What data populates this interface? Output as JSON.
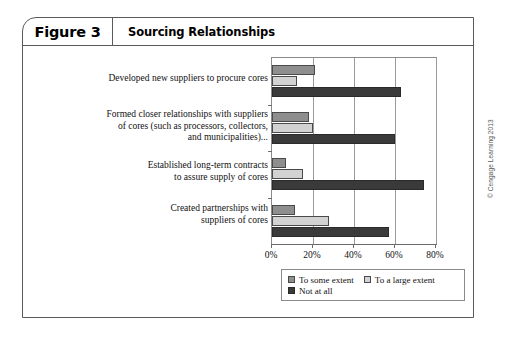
{
  "figure": {
    "number_label": "Figure 3",
    "title": "Sourcing Relationships",
    "copyright": "© Cengage Learning 2013"
  },
  "chart_data": {
    "type": "bar",
    "orientation": "horizontal",
    "title": "Sourcing Relationships",
    "xlabel": "",
    "ylabel": "",
    "xlim": [
      0,
      80
    ],
    "xticks": [
      0,
      20,
      40,
      60,
      80
    ],
    "xtick_labels": [
      "0%",
      "20%",
      "40%",
      "60%",
      "80%"
    ],
    "grid": true,
    "legend_position": "bottom",
    "categories": [
      "Developed new suppliers to procure cores",
      "Formed closer relationships with suppliers of cores (such as processors, collectors, and municipalities)...",
      "Established long-term contracts to assure supply of cores",
      "Created partnerships with suppliers of cores"
    ],
    "category_lines": [
      [
        "Developed new suppliers to procure cores"
      ],
      [
        "Formed closer relationships with suppliers",
        "of cores (such as processors, collectors,",
        "and municipalities)..."
      ],
      [
        "Established long-term contracts",
        "to assure supply of cores"
      ],
      [
        "Created partnerships with",
        "suppliers of cores"
      ]
    ],
    "series": [
      {
        "name": "To some extent",
        "color": "#8e8e8e",
        "values": [
          21,
          18,
          7,
          11
        ]
      },
      {
        "name": "To a large extent",
        "color": "#d2d2d2",
        "values": [
          12,
          20,
          15,
          28
        ]
      },
      {
        "name": "Not at all",
        "color": "#3a3a3a",
        "values": [
          63,
          60,
          74,
          57
        ]
      }
    ]
  },
  "legend": {
    "items": [
      {
        "label": "To some extent"
      },
      {
        "label": "To a large extent"
      },
      {
        "label": "Not at all"
      }
    ]
  }
}
